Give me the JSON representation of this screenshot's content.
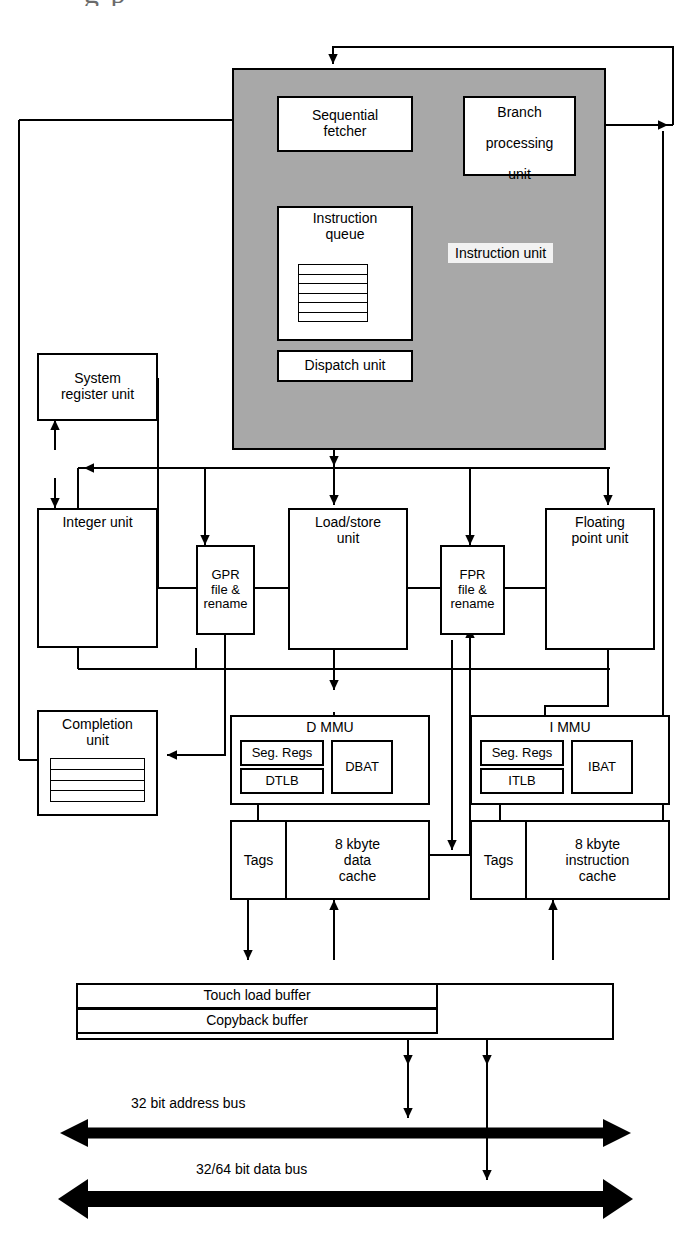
{
  "diagram": {
    "partial_caption_artifact": "g p",
    "instruction_unit_label": "Instruction unit"
  },
  "blocks": {
    "sequential_fetcher": "Sequential\nfetcher",
    "sequential_fetcher_l1": "Sequential",
    "sequential_fetcher_l2": "fetcher",
    "branch_processing_unit_l1": "Branch",
    "branch_processing_unit_l2": "processing",
    "branch_processing_unit_l3": "unit",
    "instruction_queue_l1": "Instruction",
    "instruction_queue_l2": "queue",
    "dispatch_unit": "Dispatch unit",
    "system_register_unit_l1": "System",
    "system_register_unit_l2": "register unit",
    "integer_unit": "Integer unit",
    "gpr_file_rename_l1": "GPR",
    "gpr_file_rename_l2": "file &",
    "gpr_file_rename_l3": "rename",
    "load_store_unit_l1": "Load/store",
    "load_store_unit_l2": "unit",
    "fpr_file_rename_l1": "FPR",
    "fpr_file_rename_l2": "file &",
    "fpr_file_rename_l3": "rename",
    "floating_point_unit_l1": "Floating",
    "floating_point_unit_l2": "point unit",
    "completion_unit_l1": "Completion",
    "completion_unit_l2": "unit",
    "d_mmu": "D MMU",
    "i_mmu": "I MMU",
    "seg_regs": "Seg. Regs",
    "dtlb": "DTLB",
    "itlb": "ITLB",
    "dbat": "DBAT",
    "ibat": "IBAT",
    "tags": "Tags",
    "data_cache_l1": "8 kbyte",
    "data_cache_l2": "data",
    "data_cache_l3": "cache",
    "instruction_cache_l1": "8 kbyte",
    "instruction_cache_l2": "instruction",
    "instruction_cache_l3": "cache",
    "touch_load_buffer": "Touch load buffer",
    "copyback_buffer": "Copyback buffer",
    "processor_bus_interface": "Processor bus interface"
  },
  "buses": {
    "address_bus": "32 bit address bus",
    "data_bus": "32/64 bit data bus"
  },
  "colors": {
    "instruction_unit_fill": "#a8a8a8",
    "box_fill": "#ffffff",
    "line": "#000000",
    "label_fill": "#f2f2f2"
  }
}
